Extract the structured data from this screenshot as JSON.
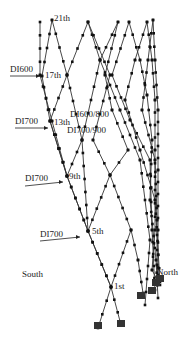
{
  "figure": {
    "type": "diagrid structural tower diagram",
    "line_color": "#333333",
    "node_color": "#111111"
  },
  "labels": {
    "floors": [
      {
        "text": "21th",
        "x": 54,
        "y": 14
      },
      {
        "text": "17th",
        "x": 45,
        "y": 71
      },
      {
        "text": "13th",
        "x": 54,
        "y": 118
      },
      {
        "text": "9th",
        "x": 69,
        "y": 172
      },
      {
        "text": "5th",
        "x": 92,
        "y": 227
      },
      {
        "text": "1st",
        "x": 114,
        "y": 282
      }
    ],
    "sections": [
      {
        "text": "DI600",
        "x": 10,
        "y": 65
      },
      {
        "text": "DI700",
        "x": 15,
        "y": 117
      },
      {
        "text": "DI700",
        "x": 25,
        "y": 174
      },
      {
        "text": "DI700",
        "x": 40,
        "y": 230
      }
    ],
    "center_sections": [
      {
        "text": "DI600/800",
        "x": 70,
        "y": 110
      },
      {
        "text": "DI700/900",
        "x": 67,
        "y": 126
      }
    ],
    "orientation": {
      "south": {
        "text": "South",
        "x": 22,
        "y": 270
      },
      "north": {
        "text": "North",
        "x": 157,
        "y": 268
      }
    }
  },
  "geometry": {
    "lines": [
      [
        [
          40,
          22
        ],
        [
          40,
          75
        ],
        [
          52,
          121
        ],
        [
          67,
          176
        ],
        [
          88,
          231
        ],
        [
          111,
          287
        ],
        [
          121,
          325
        ]
      ],
      [
        [
          52,
          20
        ],
        [
          42,
          76
        ],
        [
          50,
          121
        ],
        [
          67,
          176
        ],
        [
          88,
          231
        ],
        [
          111,
          287
        ],
        [
          98,
          328
        ]
      ],
      [
        [
          52,
          20
        ],
        [
          67,
          75
        ],
        [
          82,
          140
        ],
        [
          67,
          176
        ],
        [
          50,
          121
        ]
      ],
      [
        [
          88,
          22
        ],
        [
          67,
          75
        ],
        [
          50,
          121
        ]
      ],
      [
        [
          88,
          22
        ],
        [
          110,
          75
        ],
        [
          93,
          140
        ],
        [
          110,
          175
        ],
        [
          131,
          230
        ],
        [
          111,
          287
        ]
      ],
      [
        [
          88,
          22
        ],
        [
          100,
          60
        ],
        [
          120,
          110
        ],
        [
          140,
          160
        ],
        [
          150,
          240
        ],
        [
          145,
          305
        ]
      ],
      [
        [
          118,
          22
        ],
        [
          100,
          60
        ],
        [
          82,
          140
        ],
        [
          88,
          231
        ]
      ],
      [
        [
          118,
          22
        ],
        [
          105,
          75
        ],
        [
          112,
          110
        ],
        [
          128,
          150
        ],
        [
          110,
          175
        ],
        [
          88,
          231
        ]
      ],
      [
        [
          129,
          22
        ],
        [
          140,
          60
        ],
        [
          147,
          95
        ],
        [
          152,
          140
        ],
        [
          150,
          200
        ],
        [
          156,
          260
        ],
        [
          158,
          298
        ]
      ],
      [
        [
          129,
          22
        ],
        [
          112,
          75
        ],
        [
          130,
          120
        ],
        [
          150,
          160
        ],
        [
          152,
          230
        ],
        [
          155,
          290
        ]
      ],
      [
        [
          147,
          22
        ],
        [
          135,
          60
        ],
        [
          125,
          100
        ],
        [
          140,
          150
        ],
        [
          155,
          200
        ],
        [
          160,
          282
        ]
      ],
      [
        [
          147,
          22
        ],
        [
          152,
          60
        ],
        [
          155,
          100
        ],
        [
          155,
          150
        ],
        [
          155,
          230
        ],
        [
          152,
          270
        ],
        [
          160,
          285
        ]
      ],
      [
        [
          153,
          20
        ],
        [
          155,
          60
        ],
        [
          158,
          110
        ],
        [
          158,
          170
        ],
        [
          158,
          230
        ],
        [
          158,
          280
        ]
      ],
      [
        [
          153,
          20
        ],
        [
          148,
          60
        ],
        [
          142,
          110
        ],
        [
          155,
          160
        ],
        [
          157,
          220
        ],
        [
          157,
          265
        ],
        [
          158,
          275
        ]
      ],
      [
        [
          131,
          230
        ],
        [
          138,
          260
        ],
        [
          143,
          293
        ]
      ]
    ],
    "supports": [
      [
        98,
        325
      ],
      [
        121,
        323
      ],
      [
        141,
        295
      ],
      [
        152,
        290
      ],
      [
        156,
        282
      ],
      [
        160,
        278
      ]
    ],
    "leaders": [
      {
        "from": [
          10,
          76
        ],
        "to": [
          40,
          76
        ]
      },
      {
        "from": [
          15,
          128
        ],
        "to": [
          48,
          128
        ]
      },
      {
        "from": [
          25,
          186
        ],
        "to": [
          63,
          182
        ]
      },
      {
        "from": [
          40,
          241
        ],
        "to": [
          80,
          237
        ]
      }
    ]
  }
}
